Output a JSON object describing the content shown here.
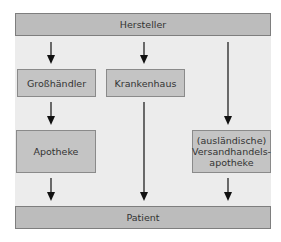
{
  "diagram": {
    "nodes": {
      "hersteller": "Hersteller",
      "grosshaendler": "Großhändler",
      "krankenhaus": "Krankenhaus",
      "apotheke": "Apotheke",
      "versand_line1": "(ausländische)",
      "versand_line2": "Versandhandels-",
      "versand_line3": "apotheke",
      "patient": "Patient"
    },
    "edges": [
      {
        "from": "Hersteller",
        "to": "Großhändler"
      },
      {
        "from": "Hersteller",
        "to": "Krankenhaus"
      },
      {
        "from": "Hersteller",
        "to": "(ausländische) Versandhandelsapotheke"
      },
      {
        "from": "Großhändler",
        "to": "Apotheke"
      },
      {
        "from": "Apotheke",
        "to": "Patient"
      },
      {
        "from": "Krankenhaus",
        "to": "Patient"
      },
      {
        "from": "(ausländische) Versandhandelsapotheke",
        "to": "Patient"
      }
    ],
    "colors": {
      "frame_background": "#ececec",
      "box_fill": "#c4c4c4",
      "box_border": "#8a8a8a",
      "arrow": "#111111",
      "text": "#333333"
    }
  }
}
